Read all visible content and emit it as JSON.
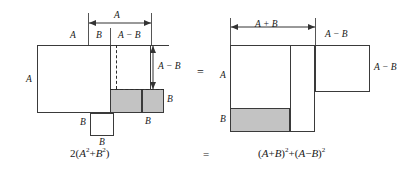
{
  "figure": {
    "title_equation_left": "2(A² + B²)",
    "title_equation_right": "(A + B)² + (A − B)²",
    "equals_middle": "=",
    "equals_bottom": "=",
    "fill_color": "#c3c3c3",
    "stroke_color": "#3a3a3a"
  },
  "left_figure": {
    "labels": {
      "top_dim_A": "A",
      "top_B": "B",
      "top_A_minus_B": "A − B",
      "top_left_A": "A",
      "left_A": "A",
      "right_A_minus_B": "A − B",
      "right_B": "B",
      "bottom_left_B": "B",
      "bottom_center_B": "B",
      "bottom_right_B": "B"
    },
    "equation": {
      "coefficient": "2",
      "open": "(",
      "term1_base": "A",
      "term1_exp": "2",
      "plus": "+",
      "term2_base": "B",
      "term2_exp": "2",
      "close": ")"
    }
  },
  "right_figure": {
    "labels": {
      "top_dim_A_plus_B": "A + B",
      "top_A_minus_B": "A − B",
      "left_A": "A",
      "left_B": "B",
      "right_A_minus_B": "A − B"
    },
    "equation": {
      "open1": "(",
      "a1": "A",
      "plus1": "+",
      "b1": "B",
      "close1": ")",
      "exp1": "2",
      "plus_mid": "+",
      "open2": "(",
      "a2": "A",
      "minus2": "−",
      "b2": "B",
      "close2": ")",
      "exp2": "2"
    }
  }
}
